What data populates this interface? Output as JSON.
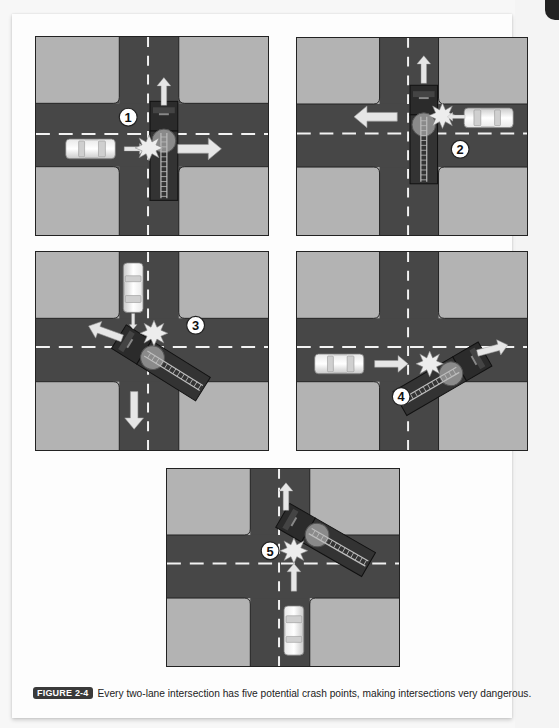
{
  "figure": {
    "label": "FIGURE 2-4",
    "caption": "Every two-lane intersection has five potential crash points, making intersections very dangerous."
  },
  "colors": {
    "block": "#b3b3b3",
    "road": "#474747",
    "lane_marking": "#f2f2f2",
    "border": "#222222",
    "badge": "#3a3a3a"
  },
  "panels": [
    {
      "number": "1",
      "description": "Car approaching from the left strikes the side of a northbound fire truck in the intersection"
    },
    {
      "number": "2",
      "description": "Car approaching from the right strikes the side of a northbound fire truck crossing the intersection"
    },
    {
      "number": "3",
      "description": "Southbound car strikes a fire truck turning diagonally through the intersection"
    },
    {
      "number": "4",
      "description": "Eastbound car strikes a fire truck turning diagonally into the eastbound lane"
    },
    {
      "number": "5",
      "description": "Northbound car strikes a fire truck turning diagonally across the intersection"
    }
  ]
}
